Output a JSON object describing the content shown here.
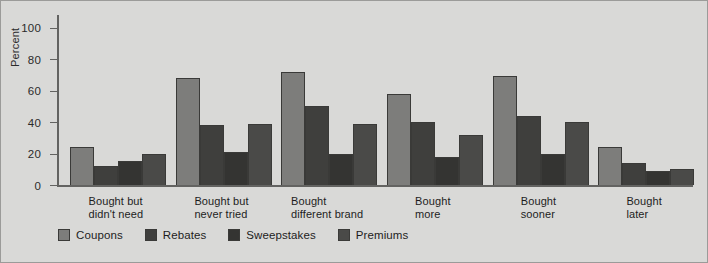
{
  "chart_data": {
    "type": "bar",
    "title": "",
    "xlabel": "",
    "ylabel": "Percent",
    "ylim": [
      0,
      108
    ],
    "yticks": [
      0,
      20,
      40,
      60,
      80,
      100
    ],
    "ytick_labels": [
      "0",
      "20",
      "40",
      "60",
      "80",
      "100"
    ],
    "grid": false,
    "legend_position": "bottom-left",
    "categories": [
      "Bought but\ndidn't need",
      "Bought but\nnever tried",
      "Bought\ndifferent brand",
      "Bought\nmore",
      "Bought\nsooner",
      "Bought\nlater"
    ],
    "category_lines": [
      [
        "Bought but",
        "didn't need"
      ],
      [
        "Bought but",
        "never tried"
      ],
      [
        "Bought",
        "different brand"
      ],
      [
        "Bought",
        "more"
      ],
      [
        "Bought",
        "sooner"
      ],
      [
        "Bought",
        "later"
      ]
    ],
    "series": [
      {
        "name": "Coupons",
        "color": "#7d7d7b",
        "values": [
          24,
          68,
          72,
          58,
          69,
          24
        ]
      },
      {
        "name": "Rebates",
        "color": "#3f3f3d",
        "values": [
          12,
          38,
          50,
          40,
          44,
          14
        ]
      },
      {
        "name": "Sweepstakes",
        "color": "#343432",
        "values": [
          15,
          21,
          20,
          18,
          20,
          9
        ]
      },
      {
        "name": "Premiums",
        "color": "#4a4a48",
        "values": [
          20,
          39,
          39,
          32,
          40,
          10
        ]
      }
    ]
  },
  "legend": {
    "items": [
      {
        "label": "Coupons"
      },
      {
        "label": "Rebates"
      },
      {
        "label": "Sweepstakes"
      },
      {
        "label": "Premiums"
      }
    ]
  },
  "style": {
    "background": "#d9d9d7",
    "axis_color": "#636361",
    "border_color": "#9b9b99",
    "bar_outline": "#3a3a38"
  }
}
